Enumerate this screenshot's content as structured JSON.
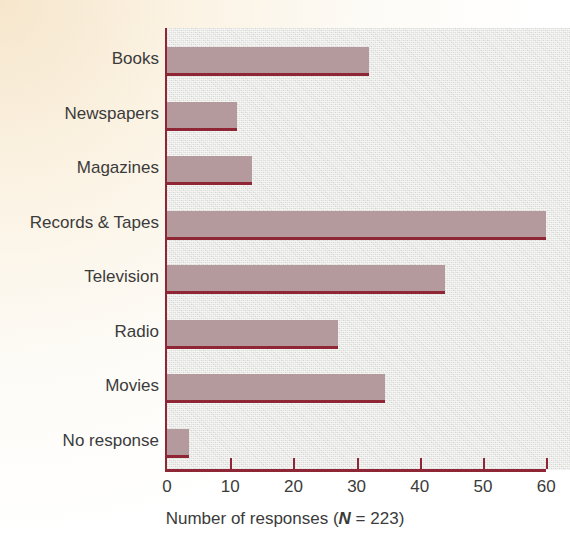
{
  "chart_data": {
    "type": "bar",
    "orientation": "horizontal",
    "title": "",
    "xlabel": "Number of responses (N = 223)",
    "ylabel": "",
    "xlim": [
      0,
      60
    ],
    "grid": false,
    "legend": null,
    "categories": [
      "Books",
      "Newspapers",
      "Magazines",
      "Records & Tapes",
      "Television",
      "Radio",
      "Movies",
      "No response"
    ],
    "values": [
      32,
      11,
      13.5,
      60,
      44,
      27,
      34.5,
      3.5
    ],
    "x_ticks": [
      0,
      10,
      20,
      30,
      40,
      50,
      60
    ],
    "x_tick_labels": [
      "0",
      "10",
      "20",
      "30",
      "40",
      "50",
      "60"
    ],
    "colors": {
      "bar_fill": "#b59a9d",
      "bar_rule": "#8e2636",
      "axis": "#8e2636",
      "plot_background": "#e2e2df",
      "page_background": "#fdfaf2",
      "text": "#3b3b3b"
    }
  },
  "axis_title": {
    "prefix": "Number of responses (",
    "n_symbol": "N",
    "suffix": " = 223)"
  }
}
